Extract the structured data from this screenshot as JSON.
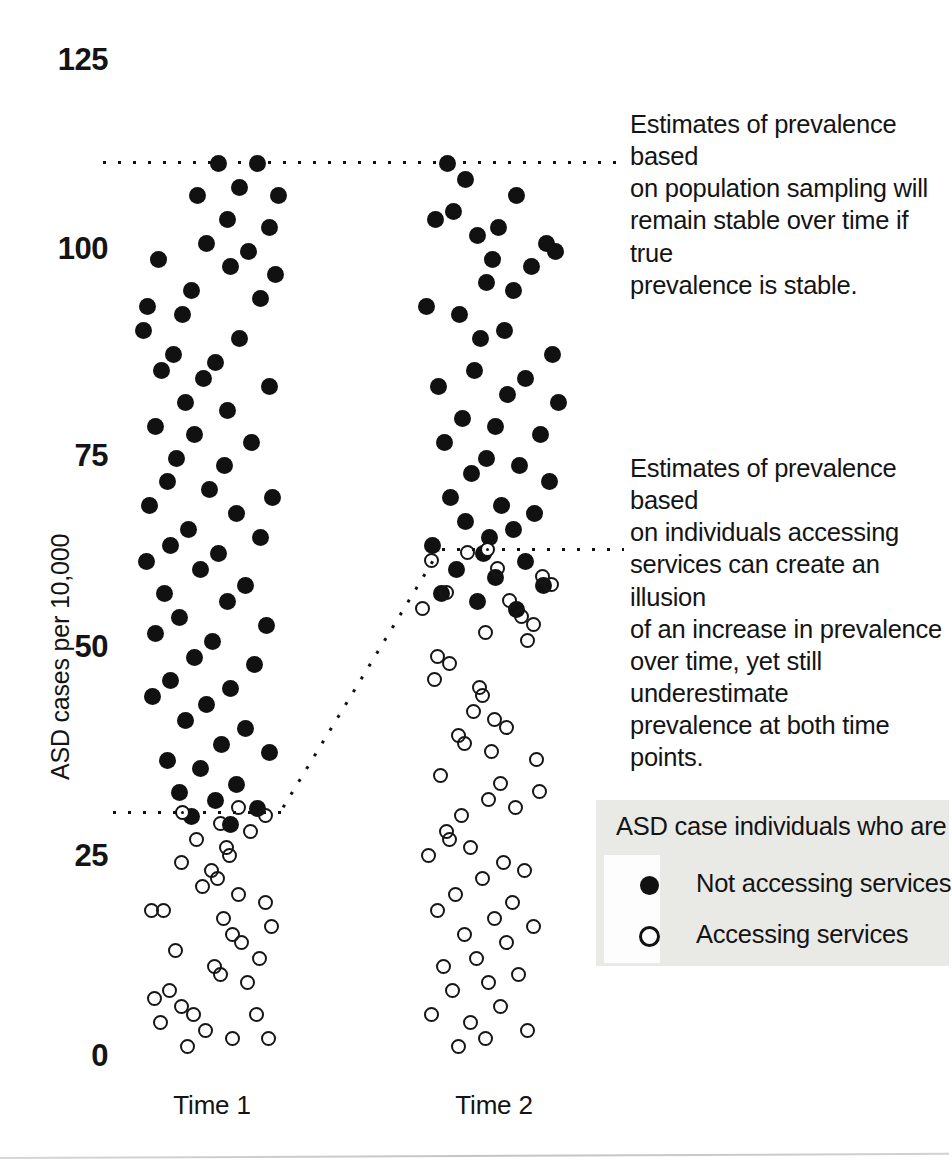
{
  "chart_data": {
    "type": "scatter",
    "title": "",
    "xlabel": "",
    "ylabel": "ASD cases per 10,000",
    "ylim": [
      0,
      125
    ],
    "yticks": [
      0,
      25,
      50,
      75,
      100,
      125
    ],
    "ytick_labels": [
      "0",
      "25",
      "50",
      "75",
      "100",
      "125"
    ],
    "categories": [
      "Time 1",
      "Time 2"
    ],
    "grid": false,
    "legend_position": "bottom-right",
    "legend_title": "ASD case individuals who are",
    "series": [
      {
        "name": "Not accessing services",
        "marker": "filled-circle",
        "color": "#111111",
        "points_time1": [
          [
            0.52,
            112
          ],
          [
            0.78,
            112
          ],
          [
            0.38,
            108
          ],
          [
            0.66,
            109
          ],
          [
            0.92,
            108
          ],
          [
            0.58,
            105
          ],
          [
            0.86,
            104
          ],
          [
            0.44,
            102
          ],
          [
            0.72,
            101
          ],
          [
            0.12,
            100
          ],
          [
            0.6,
            99
          ],
          [
            0.9,
            98
          ],
          [
            0.34,
            96
          ],
          [
            0.8,
            95
          ],
          [
            0.05,
            94
          ],
          [
            0.28,
            93
          ],
          [
            0.02,
            91
          ],
          [
            0.66,
            90
          ],
          [
            0.22,
            88
          ],
          [
            0.5,
            87
          ],
          [
            0.14,
            86
          ],
          [
            0.42,
            85
          ],
          [
            0.86,
            84
          ],
          [
            0.3,
            82
          ],
          [
            0.58,
            81
          ],
          [
            0.1,
            79
          ],
          [
            0.36,
            78
          ],
          [
            0.74,
            77
          ],
          [
            0.24,
            75
          ],
          [
            0.56,
            74
          ],
          [
            0.18,
            72
          ],
          [
            0.46,
            71
          ],
          [
            0.88,
            70
          ],
          [
            0.06,
            69
          ],
          [
            0.64,
            68
          ],
          [
            0.32,
            66
          ],
          [
            0.8,
            65
          ],
          [
            0.2,
            64
          ],
          [
            0.52,
            63
          ],
          [
            0.04,
            62
          ],
          [
            0.4,
            61
          ],
          [
            0.7,
            59
          ],
          [
            0.16,
            58
          ],
          [
            0.58,
            57
          ],
          [
            0.26,
            55
          ],
          [
            0.84,
            54
          ],
          [
            0.1,
            53
          ],
          [
            0.48,
            52
          ],
          [
            0.36,
            50
          ],
          [
            0.76,
            49
          ],
          [
            0.2,
            47
          ],
          [
            0.6,
            46
          ],
          [
            0.08,
            45
          ],
          [
            0.44,
            44
          ],
          [
            0.3,
            42
          ],
          [
            0.7,
            41
          ],
          [
            0.54,
            39
          ],
          [
            0.86,
            38
          ],
          [
            0.18,
            37
          ],
          [
            0.4,
            36
          ],
          [
            0.64,
            34
          ],
          [
            0.26,
            33
          ],
          [
            0.5,
            32
          ],
          [
            0.78,
            31
          ],
          [
            0.34,
            30
          ],
          [
            0.6,
            29
          ]
        ],
        "points_time2": [
          [
            0.18,
            112
          ],
          [
            0.3,
            110
          ],
          [
            0.64,
            108
          ],
          [
            0.22,
            106
          ],
          [
            0.1,
            105
          ],
          [
            0.52,
            104
          ],
          [
            0.38,
            103
          ],
          [
            0.84,
            102
          ],
          [
            0.9,
            101
          ],
          [
            0.48,
            100
          ],
          [
            0.74,
            99
          ],
          [
            0.44,
            97
          ],
          [
            0.62,
            96
          ],
          [
            0.04,
            94
          ],
          [
            0.26,
            93
          ],
          [
            0.56,
            91
          ],
          [
            0.4,
            90
          ],
          [
            0.88,
            88
          ],
          [
            0.36,
            86
          ],
          [
            0.7,
            85
          ],
          [
            0.12,
            84
          ],
          [
            0.58,
            83
          ],
          [
            0.92,
            82
          ],
          [
            0.28,
            80
          ],
          [
            0.5,
            79
          ],
          [
            0.8,
            78
          ],
          [
            0.16,
            77
          ],
          [
            0.44,
            75
          ],
          [
            0.66,
            74
          ],
          [
            0.34,
            73
          ],
          [
            0.86,
            72
          ],
          [
            0.2,
            70
          ],
          [
            0.54,
            69
          ],
          [
            0.76,
            68
          ],
          [
            0.3,
            67
          ],
          [
            0.62,
            66
          ],
          [
            0.08,
            64
          ],
          [
            0.42,
            63
          ],
          [
            0.7,
            62
          ],
          [
            0.24,
            61
          ],
          [
            0.5,
            60
          ],
          [
            0.82,
            59
          ],
          [
            0.14,
            58
          ],
          [
            0.38,
            57
          ],
          [
            0.64,
            56
          ],
          [
            0.46,
            65
          ]
        ]
      },
      {
        "name": "Accessing services",
        "marker": "open-circle",
        "color": "#161616",
        "points_time1": [
          [
            0.66,
            31
          ],
          [
            0.84,
            30
          ],
          [
            0.54,
            29
          ],
          [
            0.74,
            28
          ],
          [
            0.38,
            27
          ],
          [
            0.58,
            26
          ],
          [
            0.6,
            25
          ],
          [
            0.28,
            24
          ],
          [
            0.48,
            23
          ],
          [
            0.52,
            22
          ],
          [
            0.42,
            21
          ],
          [
            0.66,
            20
          ],
          [
            0.84,
            19
          ],
          [
            0.08,
            18
          ],
          [
            0.16,
            18
          ],
          [
            0.56,
            17
          ],
          [
            0.88,
            16
          ],
          [
            0.62,
            15
          ],
          [
            0.68,
            14
          ],
          [
            0.24,
            13
          ],
          [
            0.8,
            12
          ],
          [
            0.5,
            11
          ],
          [
            0.54,
            10
          ],
          [
            0.72,
            9
          ],
          [
            0.2,
            8
          ],
          [
            0.1,
            7
          ],
          [
            0.28,
            6
          ],
          [
            0.36,
            5
          ],
          [
            0.78,
            5
          ],
          [
            0.14,
            4
          ],
          [
            0.44,
            3
          ],
          [
            0.62,
            2
          ],
          [
            0.86,
            2
          ],
          [
            0.32,
            1
          ]
        ],
        "points_time2": [
          [
            0.32,
            63
          ],
          [
            0.08,
            62
          ],
          [
            0.52,
            61
          ],
          [
            0.82,
            60
          ],
          [
            0.88,
            59
          ],
          [
            0.18,
            58
          ],
          [
            0.6,
            57
          ],
          [
            0.02,
            56
          ],
          [
            0.68,
            55
          ],
          [
            0.76,
            54
          ],
          [
            0.44,
            53
          ],
          [
            0.72,
            52
          ],
          [
            0.12,
            50
          ],
          [
            0.2,
            49
          ],
          [
            0.1,
            47
          ],
          [
            0.4,
            46
          ],
          [
            0.42,
            45
          ],
          [
            0.36,
            43
          ],
          [
            0.5,
            42
          ],
          [
            0.58,
            41
          ],
          [
            0.26,
            40
          ],
          [
            0.3,
            39
          ],
          [
            0.48,
            38
          ],
          [
            0.78,
            37
          ],
          [
            0.14,
            35
          ],
          [
            0.54,
            34
          ],
          [
            0.8,
            33
          ],
          [
            0.46,
            32
          ],
          [
            0.64,
            31
          ],
          [
            0.28,
            30
          ],
          [
            0.18,
            28
          ],
          [
            0.2,
            27
          ],
          [
            0.34,
            26
          ],
          [
            0.06,
            25
          ],
          [
            0.56,
            24
          ],
          [
            0.7,
            23
          ],
          [
            0.42,
            22
          ],
          [
            0.24,
            20
          ],
          [
            0.62,
            19
          ],
          [
            0.12,
            18
          ],
          [
            0.5,
            17
          ],
          [
            0.76,
            16
          ],
          [
            0.3,
            15
          ],
          [
            0.58,
            14
          ],
          [
            0.38,
            12
          ],
          [
            0.16,
            11
          ],
          [
            0.66,
            10
          ],
          [
            0.46,
            9
          ],
          [
            0.22,
            8
          ],
          [
            0.54,
            6
          ],
          [
            0.08,
            5
          ],
          [
            0.34,
            4
          ],
          [
            0.72,
            3
          ],
          [
            0.44,
            2
          ],
          [
            0.26,
            1
          ]
        ]
      }
    ],
    "reference_lines": [
      {
        "name": "population-sampling-reference",
        "style": "dotted",
        "value": 112,
        "description": "flat dotted line across both time points at true prevalence"
      },
      {
        "name": "service-access-reference",
        "style": "dotted",
        "description": "stepped dotted line rising from Time 1 threshold to Time 2 threshold",
        "value_time1": 31,
        "value_time2": 63
      }
    ],
    "annotations": [
      "Estimates of prevalence based on population sampling will remain stable over time if true prevalence is stable.",
      "Estimates of prevalence based on individuals accessing services can create an illusion of an increase in prevalence over time, yet still underestimate prevalence at both time points."
    ]
  },
  "axis": {
    "y_title": "ASD cases per 10,000",
    "y_ticks": [
      "125",
      "100",
      "75",
      "50",
      "25",
      "0"
    ],
    "x_ticks": [
      "Time 1",
      "Time 2"
    ]
  },
  "annotations": {
    "top": {
      "lines": [
        "Estimates of prevalence based",
        "on population sampling will",
        "remain stable over time if true",
        "prevalence is stable."
      ]
    },
    "bottom": {
      "lines": [
        "Estimates of prevalence based",
        "on individuals accessing",
        "services can create an illusion",
        "of an increase in prevalence",
        "over time, yet still underestimate",
        "prevalence at both time points."
      ]
    }
  },
  "legend": {
    "title": "ASD case individuals who are",
    "items": [
      {
        "marker": "filled-circle-icon",
        "label": "Not accessing services"
      },
      {
        "marker": "open-circle-icon",
        "label": "Accessing services"
      }
    ]
  },
  "colors": {
    "marker_filled": "#111111",
    "marker_open_stroke": "#161616",
    "legend_background": "#e9e9e6",
    "text": "#141414",
    "background": "#ffffff"
  }
}
